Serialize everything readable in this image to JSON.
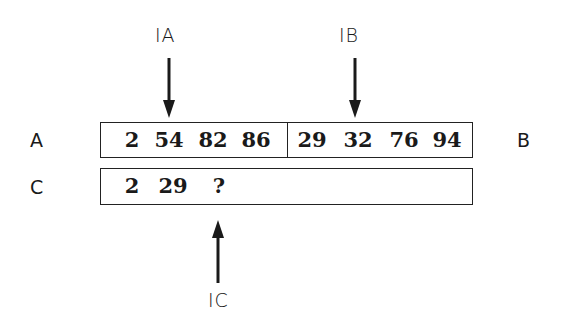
{
  "pointers": {
    "ia": {
      "label": "IA",
      "target": "array A",
      "points_to_index": 1
    },
    "ib": {
      "label": "IB",
      "target": "array B",
      "points_to_index": 1
    },
    "ic": {
      "label": "IC",
      "target": "array C",
      "points_to_index": 2
    }
  },
  "arrays": {
    "a": {
      "label": "A",
      "values": [
        "2",
        "54",
        "82",
        "86"
      ]
    },
    "b": {
      "label": "B",
      "values": [
        "29",
        "32",
        "76",
        "94"
      ]
    },
    "c": {
      "label": "C",
      "values": [
        "2",
        "29",
        "?"
      ]
    }
  }
}
